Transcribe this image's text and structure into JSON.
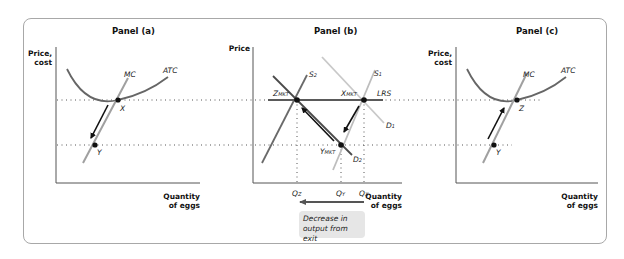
{
  "panels": {
    "a": {
      "title": "Panel (a)",
      "y_axis_line1": "Price,",
      "y_axis_line2": "cost",
      "x_axis_line1": "Quantity",
      "x_axis_line2": "of eggs",
      "curves": {
        "mc": "MC",
        "atc": "ATC"
      },
      "points": {
        "x": "X",
        "y": "Y"
      }
    },
    "b": {
      "title": "Panel (b)",
      "y_axis": "Price",
      "x_axis_line1": "Quantity",
      "x_axis_line2": "of eggs",
      "curves": {
        "s1": "S",
        "s1_sub": "1",
        "s2": "S",
        "s2_sub": "2",
        "d1": "D",
        "d1_sub": "1",
        "d2": "D",
        "d2_sub": "2",
        "lrs": "LRS"
      },
      "points": {
        "z": "Z",
        "z_sub": "MKT",
        "x": "X",
        "x_sub": "MKT",
        "y": "Y",
        "y_sub": "MKT"
      },
      "quantities": {
        "qz": "Q",
        "qz_sub": "Z",
        "qy": "Q",
        "qy_sub": "Y",
        "qx": "Q",
        "qx_sub": "X"
      },
      "annotation_line1": "Decrease in",
      "annotation_line2": "output from exit"
    },
    "c": {
      "title": "Panel (c)",
      "y_axis_line1": "Price,",
      "y_axis_line2": "cost",
      "x_axis_line1": "Quantity",
      "x_axis_line2": "of eggs",
      "curves": {
        "mc": "MC",
        "atc": "ATC"
      },
      "points": {
        "z": "Z",
        "y": "Y"
      }
    }
  },
  "colors": {
    "frame": "#a8a8a8",
    "atc": "#666666",
    "mc": "#a0a0a0",
    "lrs": "#5a5a5a",
    "s2": "#6a6a6a",
    "s1": "#bdbdbd",
    "d1": "#c8c8c8",
    "d2": "#4a4a4a",
    "arrow": "#111111",
    "note_bg": "#e6e6e6"
  }
}
